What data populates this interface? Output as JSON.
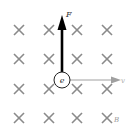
{
  "diagram": {
    "title": "",
    "field": {
      "symbol": "×",
      "direction": "into page",
      "label": "B",
      "rows": [
        30,
        59,
        89,
        118
      ],
      "cols": [
        19,
        49,
        77,
        107
      ],
      "color": "#8a8a8a"
    },
    "particle": {
      "label": "e",
      "cx": 62,
      "cy": 80,
      "r": 8
    },
    "force": {
      "label": "F",
      "direction": "up",
      "color": "#000000"
    },
    "velocity": {
      "label": "v",
      "direction": "right",
      "color": "#9a9a9a"
    }
  }
}
